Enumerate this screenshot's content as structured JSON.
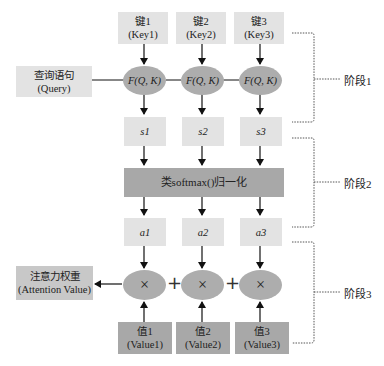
{
  "keys": [
    {
      "cn": "键1",
      "en": "(Key1)"
    },
    {
      "cn": "键2",
      "en": "(Key2)"
    },
    {
      "cn": "键3",
      "en": "(Key3)"
    }
  ],
  "query": {
    "cn": "查询语句",
    "en": "(Query)"
  },
  "similarity_fn": [
    "F(Q, K)",
    "F(Q, K)",
    "F(Q, K)"
  ],
  "scores": [
    "s1",
    "s2",
    "s3"
  ],
  "normalize": {
    "label": "类softmax()归一化"
  },
  "weights": [
    "a1",
    "a2",
    "a3"
  ],
  "multiply_op": [
    "×",
    "×",
    "×"
  ],
  "plus_op": [
    "+",
    "+"
  ],
  "values": [
    {
      "cn": "值1",
      "en": "(Value1)"
    },
    {
      "cn": "值2",
      "en": "(Value2)"
    },
    {
      "cn": "值3",
      "en": "(Value3)"
    }
  ],
  "output": {
    "cn": "注意力权重",
    "en": "(Attention Value)"
  },
  "stages": [
    "阶段1",
    "阶段2",
    "阶段3"
  ],
  "colors": {
    "light_box": "#e3e3e3",
    "mid_box": "#c8c8c8",
    "dark_box": "#a8a8a8",
    "ellipse": "#adadad"
  }
}
